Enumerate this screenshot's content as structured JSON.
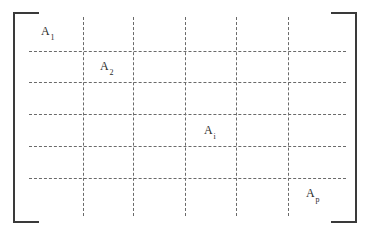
{
  "figure": {
    "kind": "partitioned-matrix-diagram",
    "width": 369,
    "height": 232,
    "background_color": "#ffffff",
    "bracket_color": "#3a3a3a",
    "grid_color": "#6a6a6a",
    "label_color": "#2b2b2b"
  },
  "brackets": {
    "left_label": "[",
    "right_label": "]"
  },
  "grid": {
    "style": "dashed",
    "horizontal_lines": [
      {
        "id": "h1",
        "y": 51
      },
      {
        "id": "h2",
        "y": 82
      },
      {
        "id": "h3",
        "y": 114
      },
      {
        "id": "h4",
        "y": 146
      },
      {
        "id": "h5",
        "y": 178
      }
    ],
    "vertical_lines": [
      {
        "id": "v1",
        "x": 83
      },
      {
        "id": "v2",
        "x": 133
      },
      {
        "id": "v3",
        "x": 185
      },
      {
        "id": "v4",
        "x": 236
      },
      {
        "id": "v5",
        "x": 288
      }
    ]
  },
  "labels": [
    {
      "id": "A1",
      "base": "A",
      "sub": "1",
      "x": 41,
      "y": 25
    },
    {
      "id": "A2",
      "base": "A",
      "sub": "2",
      "x": 100,
      "y": 60
    },
    {
      "id": "Ai",
      "base": "A",
      "sub": "i",
      "x": 204,
      "y": 124
    },
    {
      "id": "Ap",
      "base": "A",
      "sub": "p",
      "x": 306,
      "y": 187
    }
  ]
}
